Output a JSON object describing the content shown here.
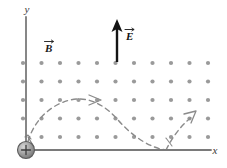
{
  "figure": {
    "background_color": "#ffffff"
  },
  "axes": {
    "x_label": "x",
    "y_label": "y",
    "color": "#7a7a7a",
    "origin": {
      "x": 26,
      "y": 150
    },
    "x_end": {
      "x": 211,
      "y": 150
    },
    "y_end": {
      "x": 26,
      "y": 17
    }
  },
  "field_b": {
    "label": "B",
    "vector_notation": "arrow-over",
    "description": "magnetic field out of page",
    "symbol": "dot-grid",
    "label_position": {
      "x": 48,
      "y": 49
    },
    "dot_color": "#9a9a9a",
    "grid": {
      "columns": 11,
      "rows": 5,
      "x_start": 23,
      "y_start": 63,
      "x_spacing": 18.5,
      "y_spacing": 18.5,
      "dot_radius": 2.1
    }
  },
  "field_e": {
    "label": "E",
    "vector_notation": "arrow-over",
    "description": "electric field pointing up",
    "color": "#141414",
    "arrow": {
      "x": 117,
      "y_tail": 62,
      "y_head": 22
    },
    "label_position": {
      "x": 126,
      "y": 36
    }
  },
  "particle": {
    "charge_symbol": "+",
    "label": "positive charge at origin",
    "position": {
      "x": 26,
      "y": 150
    },
    "radius": 8.5,
    "fill_outer": "#8f8f8f",
    "fill_inner": "#c9c9c9",
    "stroke": "#4a4a4a"
  },
  "trajectory": {
    "style": "dashed",
    "color": "#8b8b8b",
    "dash_pattern": "5,4",
    "stroke_width": 1.4,
    "description": "cycloid path of positive charge",
    "initial_velocity_arrow": {
      "from": {
        "x": 33,
        "y": 148
      },
      "to": {
        "x": 27,
        "y": 138
      }
    },
    "arch_arrow_mid": {
      "at": {
        "x": 97,
        "y": 100
      },
      "direction": "right"
    },
    "arch_arrow_end": {
      "at": {
        "x": 196,
        "y": 113
      },
      "direction": "up-right"
    },
    "cusp_points": [
      {
        "x": 26,
        "y": 150
      },
      {
        "x": 166,
        "y": 150
      }
    ],
    "apex": {
      "x": 97,
      "y": 99
    }
  }
}
